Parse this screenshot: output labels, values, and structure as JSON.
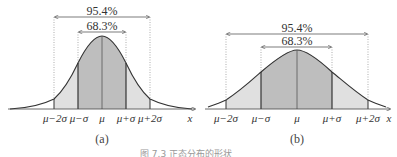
{
  "figures": [
    {
      "id": "a",
      "label": "(a)",
      "outer_pct": "95.4%",
      "inner_pct": "68.3%",
      "ticks": [
        "μ−2σ",
        "μ−σ",
        "μ",
        "μ+σ",
        "μ+2σ"
      ],
      "axis_label": "x"
    },
    {
      "id": "b",
      "label": "(b)",
      "outer_pct": "95.4%",
      "inner_pct": "68.3%",
      "ticks": [
        "μ−2σ",
        "μ−σ",
        "μ",
        "μ+σ",
        "μ+2σ"
      ],
      "axis_label": "x"
    }
  ],
  "caption": "图 7.3  正态分布的形状",
  "colors": {
    "inner_fill": "#bdbdbd",
    "outer_fill": "#dedede",
    "line": "#333333"
  }
}
